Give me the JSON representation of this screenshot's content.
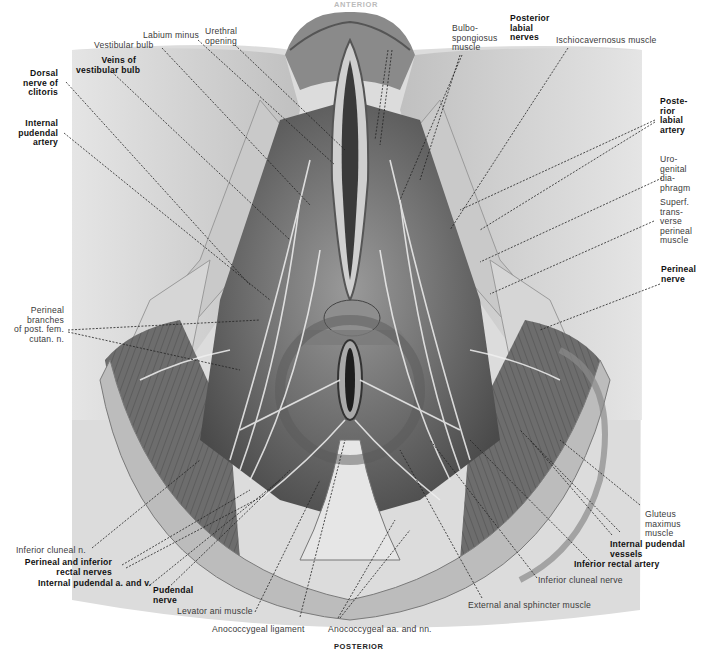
{
  "figure": {
    "orientation_top": "ANTERIOR",
    "orientation_bottom": "POSTERIOR",
    "colors": {
      "background": "#ffffff",
      "skin": "#d8d8d8",
      "muscle": "#6a6a6a",
      "dark": "#2a2a2a",
      "leader": "#222222"
    }
  },
  "labels": {
    "labium_minus": "Labium minus",
    "urethral_opening": "Urethral\nopening",
    "vestibular_bulb": "Vestibular bulb",
    "veins_of_vestibular_bulb": "Veins of\nvestibular bulb",
    "dorsal_nerve_of_clitoris": "Dorsal\nnerve of\nclitoris",
    "internal_pudendal_artery": "Internal\npudendal\nartery",
    "bulbospongiosus_muscle": "Bulbo-\nspongiosus\nmuscle",
    "posterior_labial_nerves": "Posterior\nlabial\nnerves",
    "ischiocavernosus_muscle": "Ischiocavernosus muscle",
    "posterior_labial_artery": "Poste-\nrior\nlabial\nartery",
    "urogenital_diaphragm": "Uro-\ngenital\ndia-\nphragm",
    "superf_transverse_perineal_muscle": "Superf.\ntrans-\nverse\nperineal\nmuscle",
    "perineal_nerve": "Perineal\nnerve",
    "perineal_branches_post_fem_cutan_n": "Perineal\nbranches\nof post. fem.\ncutan. n.",
    "gluteus_maximus_muscle": "Gluteus\nmaximus\nmuscle",
    "internal_pudendal_vessels": "Internal pudendal\nvessels",
    "inferior_rectal_artery": "Inferior rectal artery",
    "inferior_cluneal_nerve": "Inferior cluneal nerve",
    "external_anal_sphincter_muscle": "External anal sphincter muscle",
    "inferior_cluneal_n": "Inferior cluneal n.",
    "perineal_and_inferior_rectal_nerves": "Perineal and inferior\nrectal nerves",
    "internal_pudendal_a_and_v": "Internal pudendal a. and v.",
    "pudendal_nerve": "Pudendal\nnerve",
    "levator_ani_muscle": "Levator ani muscle",
    "anococcygeal_ligament": "Anococcygeal ligament",
    "anococcygeal_aa_and_nn": "Anococcygeal aa. and nn."
  }
}
